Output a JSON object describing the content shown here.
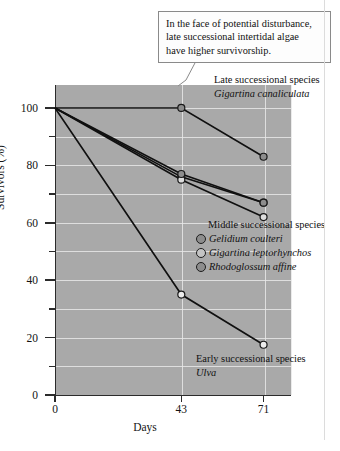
{
  "chart_data": {
    "type": "line",
    "title": "",
    "xlabel": "Days",
    "ylabel": "Survivors (%)",
    "x": [
      0,
      43,
      71
    ],
    "xticks": [
      "0",
      "43",
      "71"
    ],
    "xlim": [
      0,
      80
    ],
    "ylim": [
      0,
      108
    ],
    "yticks": [
      "0",
      "20",
      "40",
      "60",
      "80",
      "100"
    ],
    "ytick_values": [
      0,
      20,
      40,
      60,
      80,
      100
    ],
    "minor_ytick_values": [
      10,
      30,
      50,
      70,
      90
    ],
    "grid": "horizontal and vertical white gridlines on gray panel",
    "legend_position": "inline annotations inside plot",
    "series": [
      {
        "name": "Gigartina canaliculata",
        "group": "Late successional species",
        "marker": "filled-gray-circle",
        "values": [
          100,
          100,
          83
        ]
      },
      {
        "name": "Gelidium coulteri",
        "group": "Middle successional species",
        "marker": "filled-gray-circle",
        "values": [
          100,
          76,
          67
        ]
      },
      {
        "name": "Gigartina leptorhynchos",
        "group": "Middle successional species",
        "marker": "light-gray-circle",
        "values": [
          100,
          75,
          62
        ]
      },
      {
        "name": "Rhodoglossum affine",
        "group": "Middle successional species",
        "marker": "filled-gray-circle",
        "values": [
          100,
          77,
          67
        ]
      },
      {
        "name": "Ulva",
        "group": "Early successional species",
        "marker": "open-white-circle",
        "values": [
          100,
          35,
          17.5
        ]
      }
    ],
    "annotations": [
      "In the face of potential disturbance, late successional intertidal algae have higher survivorship.",
      "Late successional species Gigartina canaliculata",
      "Middle successional species",
      "Early successional species Ulva"
    ]
  },
  "callout": {
    "line1": "In the face of potential disturbance,",
    "line2": "late successional intertidal algae",
    "line3": "have higher survivorship."
  },
  "annotations": {
    "late": {
      "line1": "Late successional species",
      "line2": "Gigartina canaliculata"
    },
    "early": {
      "line1": "Early successional species",
      "line2": "Ulva"
    }
  },
  "legend": {
    "title": "Middle successional species",
    "items": [
      {
        "label": "Gelidium coulteri",
        "marker_color": "#8d8d8d"
      },
      {
        "label": "Gigartina leptorhynchos",
        "marker_color": "#c4c4c4"
      },
      {
        "label": "Rhodoglossum affine",
        "marker_color": "#8d8d8d"
      }
    ]
  },
  "colors": {
    "panel": "#a9a9a9",
    "gridline": "#e8e8e8",
    "line": "#101010",
    "marker_fill": "#8d8d8d",
    "marker_open": "#dcdcdc",
    "axis": "#2b2b2b"
  }
}
